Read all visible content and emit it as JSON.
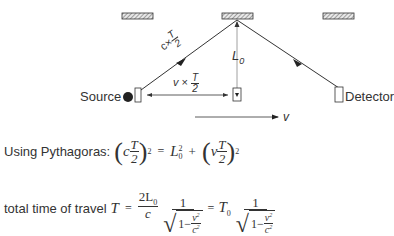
{
  "diagram": {
    "labels": {
      "source": "Source",
      "detector": "Detector",
      "height": "L",
      "height_sub": "0",
      "velocity": "v",
      "hyp_c": "c",
      "hyp_times": "×",
      "hyp_num": "T",
      "hyp_den": "2",
      "base_v": "v",
      "base_times": "×",
      "base_num": "T",
      "base_den": "2"
    },
    "elements": {
      "mirrors": [
        "left-mirror",
        "center-mirror",
        "right-mirror"
      ],
      "source_dot": "filled circle",
      "boxes": [
        "source-box",
        "middle-box",
        "detector-box"
      ]
    }
  },
  "equations": {
    "pythagoras": {
      "prefix": "Using Pythagoras:",
      "lhs_c": "c",
      "lhs_num": "T",
      "lhs_den": "2",
      "lhs_exp": "2",
      "equals": "=",
      "l0": "L",
      "l0_sub": "0",
      "l0_exp": "2",
      "plus": "+",
      "rhs_v": "v",
      "rhs_num": "T",
      "rhs_den": "2",
      "rhs_exp": "2"
    },
    "total_time": {
      "prefix": "total time of travel",
      "T": "T",
      "equals": "=",
      "num_2L0": "2L",
      "num_sub": "0",
      "den_c": "c",
      "one": "1",
      "sqrt_one": "1−",
      "sqrt_v": "v",
      "sqrt_v_exp": "2",
      "sqrt_c": "c",
      "sqrt_c_exp": "2",
      "equals2": "=",
      "T0": "T",
      "T0_sub": "0",
      "one2": "1",
      "sqrt_one2": "1−",
      "sqrt_v2": "v",
      "sqrt_v2_exp": "2",
      "sqrt_c2": "c",
      "sqrt_c2_exp": "2"
    }
  },
  "colors": {
    "line": "#333333",
    "mirror_fill": "#bbbbbb",
    "text": "#333333",
    "height_line": "#777777"
  }
}
